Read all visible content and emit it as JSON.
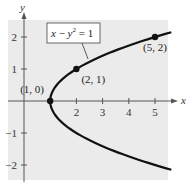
{
  "chart_data": {
    "type": "line",
    "title": "",
    "xlabel": "x",
    "ylabel": "y",
    "xlim": [
      -0.6,
      5.5
    ],
    "ylim": [
      -2.5,
      2.5
    ],
    "grid": false,
    "background": "#ebebeb",
    "curve_color": "#111111",
    "x_ticks": [
      {
        "v": 2,
        "label": "2"
      },
      {
        "v": 3,
        "label": "3"
      },
      {
        "v": 4,
        "label": "4"
      },
      {
        "v": 5,
        "label": "5"
      }
    ],
    "y_ticks": [
      {
        "v": 2,
        "label": "2"
      },
      {
        "v": 1,
        "label": "1"
      },
      {
        "v": -1,
        "label": "−1"
      },
      {
        "v": -2,
        "label": "−2"
      }
    ],
    "series": [
      {
        "name": "x − y² = 1",
        "equation": "x = y^2 + 1",
        "y_range": [
          -2.15,
          2.15
        ]
      }
    ],
    "points": [
      {
        "x": 1,
        "y": 0,
        "label": "(1, 0)"
      },
      {
        "x": 2,
        "y": 1,
        "label": "(2, 1)"
      },
      {
        "x": 5,
        "y": 2,
        "label": "(5, 2)"
      }
    ],
    "annotation": {
      "text_x": "x",
      "text_minus": " − ",
      "text_y": "y",
      "text_exp": "2",
      "text_rest": " = 1"
    }
  }
}
